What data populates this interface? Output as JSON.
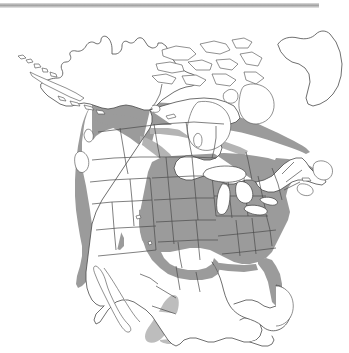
{
  "figure": {
    "kind": "range-map",
    "region": "North America",
    "background_color": "#ffffff",
    "outline_color": "#4a4a4a",
    "top_rule": {
      "visible": true,
      "color": "#9e9e9e",
      "width_px": 319
    },
    "legend": {
      "visible": false,
      "items": []
    },
    "labels": {
      "visible": false,
      "texts": []
    },
    "shading": {
      "core_color": "#9b9b9b",
      "soft_color": "#b4b4b4",
      "light_color": "#bdbdbd",
      "meaning": "shaded = species distribution / range"
    },
    "areas_shaded": [
      "Pacific Northwest coast (British Columbia, Washington, Oregon, northern California)",
      "Northern Rocky Mountains (Idaho, Montana)",
      "Southern Canadian prairies band (Alberta, Saskatchewan, Manitoba, Ontario)",
      "Great Lakes states",
      "Eastern and southeastern United States",
      "New England and Maritime fringe",
      "Florida peninsula",
      "Texas and central Great Plains",
      "Sierra Madre Occidental, Mexico (isolated patch)",
      "Trans-Mexican Volcanic Belt streaks (isolated)"
    ],
    "areas_unshaded": [
      "Alaska and Aleutian Islands",
      "Yukon, Northwest Territories, Nunavut",
      "Canadian Arctic Archipelago",
      "Greenland",
      "Hudson Bay coastlands",
      "Labrador and Newfoundland",
      "Great Basin and Desert Southwest",
      "Baja California",
      "Yucatan Peninsula and lowland Mexico"
    ]
  }
}
